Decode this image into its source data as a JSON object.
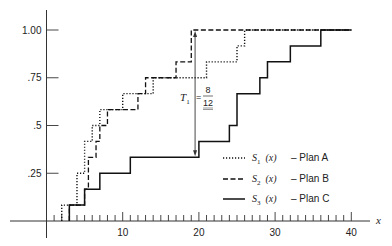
{
  "chart_data": {
    "type": "line",
    "subtype": "step",
    "title": "",
    "xlabel": "x",
    "ylabel": "",
    "xlim": [
      0,
      41
    ],
    "ylim": [
      0,
      1.08
    ],
    "x_ticks": [
      10,
      20,
      30,
      40
    ],
    "x_minor_tick_step": 1,
    "y_ticks": [
      {
        "value": 0.25,
        "label": ".25"
      },
      {
        "value": 0.5,
        "label": ".5"
      },
      {
        "value": 0.75,
        "label": ".75"
      },
      {
        "value": 1.0,
        "label": "1.00"
      }
    ],
    "grid": false,
    "legend_position": "lower right",
    "series": [
      {
        "name": "S1 (x) - Plan A",
        "symbol": "S",
        "subscript": "1",
        "arg": "(x)",
        "plan": "Plan A",
        "style": "dotted",
        "steps": [
          [
            2,
            0.0833
          ],
          [
            4,
            0.25
          ],
          [
            5,
            0.4167
          ],
          [
            6,
            0.5
          ],
          [
            7,
            0.5833
          ],
          [
            10,
            0.6667
          ],
          [
            14,
            0.75
          ],
          [
            21,
            0.8333
          ],
          [
            25,
            0.9167
          ],
          [
            26,
            1.0
          ],
          [
            40,
            1.0
          ]
        ]
      },
      {
        "name": "S2 (x) - Plan B",
        "symbol": "S",
        "subscript": "2",
        "arg": "(x)",
        "plan": "Plan B",
        "style": "dashed",
        "steps": [
          [
            3,
            0.0833
          ],
          [
            5,
            0.1667
          ],
          [
            5.5,
            0.3333
          ],
          [
            6.5,
            0.4167
          ],
          [
            7,
            0.5
          ],
          [
            8,
            0.5833
          ],
          [
            12,
            0.6667
          ],
          [
            13,
            0.75
          ],
          [
            17,
            0.8333
          ],
          [
            19,
            1.0
          ],
          [
            40,
            1.0
          ]
        ]
      },
      {
        "name": "S3 (x) - Plan C",
        "symbol": "S",
        "subscript": "3",
        "arg": "(x)",
        "plan": "Plan C",
        "style": "solid",
        "steps": [
          [
            3,
            0.0833
          ],
          [
            5,
            0.1667
          ],
          [
            7,
            0.25
          ],
          [
            11,
            0.3333
          ],
          [
            20,
            0.4167
          ],
          [
            24,
            0.5
          ],
          [
            25,
            0.6667
          ],
          [
            28,
            0.75
          ],
          [
            29,
            0.8333
          ],
          [
            32,
            0.9167
          ],
          [
            36,
            1.0
          ],
          [
            40,
            1.0
          ]
        ]
      }
    ],
    "annotations": [
      {
        "text": "T1 = 8/12",
        "label": "T",
        "subscript": "1",
        "numerator": "8",
        "denominator": "12",
        "x": 19.5,
        "y_from": 0.3333,
        "y_to": 1.0,
        "type": "double-arrow"
      }
    ]
  }
}
